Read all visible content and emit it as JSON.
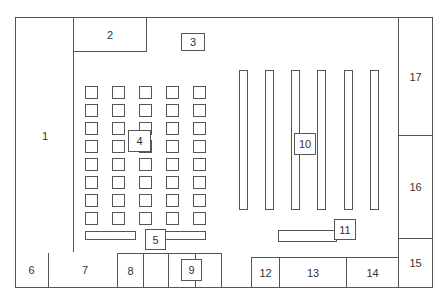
{
  "floorplan": {
    "rooms": [
      {
        "id": "1",
        "label": "1"
      },
      {
        "id": "2",
        "label": "2"
      },
      {
        "id": "3",
        "label": "3"
      },
      {
        "id": "4",
        "label": "4"
      },
      {
        "id": "5",
        "label": "5"
      },
      {
        "id": "6",
        "label": "6"
      },
      {
        "id": "7",
        "label": "7"
      },
      {
        "id": "8",
        "label": "8"
      },
      {
        "id": "9",
        "label": "9"
      },
      {
        "id": "10",
        "label": "10"
      },
      {
        "id": "11",
        "label": "11"
      },
      {
        "id": "12",
        "label": "12"
      },
      {
        "id": "13",
        "label": "13"
      },
      {
        "id": "14",
        "label": "14"
      },
      {
        "id": "15",
        "label": "15"
      },
      {
        "id": "16",
        "label": "16"
      },
      {
        "id": "17",
        "label": "17"
      }
    ],
    "seat_grid": {
      "columns": 5,
      "rows": 8
    },
    "shelves": {
      "count": 6
    },
    "colors": {
      "line": "#555555",
      "background": "#ffffff",
      "text": "#333333"
    }
  }
}
